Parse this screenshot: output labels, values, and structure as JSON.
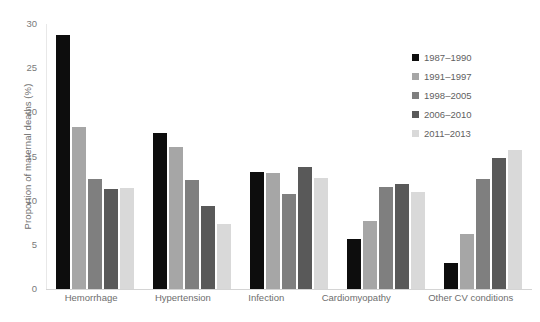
{
  "chart_data": {
    "type": "bar",
    "title": "",
    "subtitle": "",
    "xlabel": "",
    "ylabel": "Proportion of maternal deaths (%)",
    "ylim": [
      0,
      30
    ],
    "ytick_labels": [
      "30",
      "25",
      "20",
      "15",
      "10",
      "5",
      "0"
    ],
    "yticks": [
      30,
      25,
      20,
      15,
      10,
      5,
      0
    ],
    "grid": false,
    "legend_position": "top-right",
    "categories": [
      "Hemorrhage",
      "Hypertension",
      "Infection",
      "Cardiomyopathy",
      "Other CV conditions"
    ],
    "series": [
      {
        "name": "1987–1990",
        "color": "#0d0d0d",
        "values": [
          28.8,
          17.7,
          13.2,
          5.7,
          3.0
        ]
      },
      {
        "name": "1991–1997",
        "color": "#a6a6a6",
        "values": [
          18.3,
          16.1,
          13.1,
          7.7,
          6.2
        ]
      },
      {
        "name": "1998–2005",
        "color": "#7f7f7f",
        "values": [
          12.5,
          12.3,
          10.8,
          11.6,
          12.5
        ]
      },
      {
        "name": "2006–2010",
        "color": "#595959",
        "values": [
          11.3,
          9.4,
          13.8,
          11.9,
          14.8
        ]
      },
      {
        "name": "2011–2013",
        "color": "#d9d9d9",
        "values": [
          11.4,
          7.4,
          12.6,
          11.0,
          15.7
        ]
      }
    ]
  }
}
